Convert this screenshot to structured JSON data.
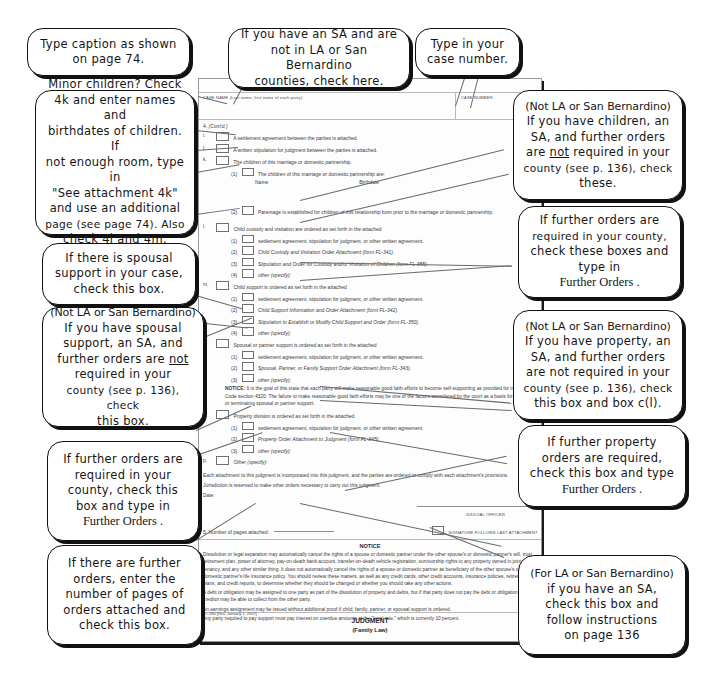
{
  "page": {
    "background": "#ffffff",
    "callout_border": "#111111",
    "form_border": "#9a9a9a"
  },
  "form": {
    "form_code": "FL-180",
    "case_name_label": "CASE NAME (Last name, first name of each party):",
    "case_number_label": "CASE NUMBER:",
    "section_number": "4.",
    "section_contd": "(Cont'd.)",
    "items": [
      {
        "letter": "i.",
        "text": "A settlement agreement between the parties is attached."
      },
      {
        "letter": "j.",
        "text": "A written stipulation for judgment between the parties is attached."
      },
      {
        "letter": "k.",
        "text": "The children of this marriage or domestic partnership."
      }
    ],
    "k_sub": [
      {
        "num": "(1)",
        "text": "The children of this marriage or domestic partnership are:",
        "cols": [
          "Name",
          "Birthdate"
        ]
      },
      {
        "num": "(2)",
        "text": "Parentage is established for children of this relationship born prior to the marriage or domestic partnership."
      }
    ],
    "l_item": {
      "letter": "l.",
      "heading": "Child custody and visitation are ordered as set forth in the attached",
      "subs": [
        {
          "num": "(1)",
          "text": "settlement agreement, stipulation for judgment, or other written agreement.",
          "italic": false
        },
        {
          "num": "(2)",
          "text": "Child Custody and Visitation Order Attachment (form FL-341).",
          "italic": true
        },
        {
          "num": "(3)",
          "text": "Stipulation and Order for Custody and/or Visitation of Children (form FL-355).",
          "italic": true
        },
        {
          "num": "(4)",
          "text": "other (specify):",
          "italic": true
        }
      ]
    },
    "m_item": {
      "letter": "m.",
      "heading": "Child support is ordered as set forth in the attached",
      "subs": [
        {
          "num": "(1)",
          "text": "settlement agreement, stipulation for judgment, or other written agreement.",
          "italic": false
        },
        {
          "num": "(2)",
          "text": "Child Support Information and Order Attachment (form FL-342).",
          "italic": true
        },
        {
          "num": "(3)",
          "text": "Stipulation to Establish or Modify Child Support and Order (form FL-350).",
          "italic": true
        },
        {
          "num": "(4)",
          "text": "other (specify):",
          "italic": true
        }
      ]
    },
    "n_item": {
      "letter": "n.",
      "heading": "Spousal or partner support is ordered as set forth in the attached",
      "subs": [
        {
          "num": "(1)",
          "text": "settlement agreement, stipulation for judgment, or other written agreement.",
          "italic": false
        },
        {
          "num": "(2)",
          "text": "Spousal, Partner, or Family Support Order Attachment (form FL-343).",
          "italic": true
        },
        {
          "num": "(3)",
          "text": "other (specify):",
          "italic": true
        }
      ],
      "notice_label": "NOTICE:",
      "notice_text": "It is the goal of this state that each party will make reasonable good faith efforts to become self-supporting as provided for in Family Code section 4320. The failure to make reasonable good faith efforts may be one of the factors considered by the court as a basis for modifying or terminating spousal or partner support."
    },
    "o_item": {
      "letter": "o.",
      "heading": "Property division is ordered as set forth in the attached",
      "subs": [
        {
          "num": "(1)",
          "text": "settlement agreement, stipulation for judgment, or other written agreement.",
          "italic": false
        },
        {
          "num": "(2)",
          "text": "Property Order Attachment to Judgment (form FL-345).",
          "italic": true
        },
        {
          "num": "(3)",
          "text": "other (specify):",
          "italic": true
        }
      ]
    },
    "p_item": {
      "letter": "p.",
      "text": "Other (specify):"
    },
    "closing": [
      "Each attachment to this judgment is incorporated into this judgment, and the parties are ordered to comply with each attachment's provisions.",
      "Jurisdiction is reserved to make other orders necessary to carry out this judgment."
    ],
    "date_label": "Date:",
    "judicial_officer_label": "JUDICIAL OFFICER",
    "pages_attached_label": "5.  Number of pages attached:",
    "signature_follows_label": "SIGNATURE FOLLOWS LAST ATTACHMENT",
    "notice_heading": "NOTICE",
    "notice_paragraphs": [
      "Dissolution or legal separation may automatically cancel the rights of a spouse or domestic partner under the other spouse's or domestic partner's will, trust, retirement plan, power of attorney, pay-on-death bank account, transfer-on-death vehicle registration, survivorship rights to any property owned in joint tenancy, and any other similar thing. It does not automatically cancel the rights of a spouse or domestic partner as beneficiary of the other spouse's or domestic partner's life insurance policy. You should review these matters, as well as any credit cards, other credit accounts, insurance policies, retirement plans, and credit reports, to determine whether they should be changed or whether you should take any other actions.",
      "A debt or obligation may be assigned to one party as part of the dissolution of property and debts, but if that party does not pay the debt or obligation, the creditor may be able to collect from the other party.",
      "An earnings assignment may be issued without additional proof if child, family, partner, or spousal support is ordered.",
      "Any party required to pay support must pay interest on overdue amounts at the \"legal rate,\" which is currently 10 percent."
    ],
    "revision": "FL-180 [Rev. January 1, 2007]",
    "judgment_title": "JUDGMENT",
    "judgment_subtitle": "(Family Law)"
  },
  "callouts": {
    "caption": {
      "name": "type-caption-callout",
      "lines": [
        "Type caption as shown",
        "on page 74."
      ]
    },
    "sa_not_la": {
      "name": "sa-not-la-callout",
      "lines": [
        "If you have an SA and are",
        "not in LA or San Bernardino",
        "counties, check here."
      ]
    },
    "case_number": {
      "name": "case-number-callout",
      "lines": [
        "Type in your",
        "case number."
      ]
    },
    "minor_children": {
      "name": "minor-children-callout",
      "lines": [
        "Minor children? Check",
        "4k and enter names and",
        "birthdates of children. If",
        "not enough room, type in",
        "\"See attachment 4k\"",
        "and use an additional",
        "page (see page 74). Also",
        "check 4l and 4m."
      ]
    },
    "spousal_support": {
      "name": "spousal-support-callout",
      "lines": [
        "If there is spousal",
        "support in your case,",
        "check this box."
      ]
    },
    "spousal_not_la": {
      "name": "spousal-not-la-callout",
      "header": "(Not LA or San Bernardino)",
      "lines": [
        "If you have spousal",
        "support, an SA, and",
        "further orders are not",
        "required in your",
        "county (see p. 136), check",
        "this box."
      ],
      "underlined_word": "not"
    },
    "further_orders_left": {
      "name": "further-orders-left-callout",
      "lines": [
        "If further orders are",
        "required in your",
        "county, check this",
        "box and type in"
      ],
      "serif_line": "Further Orders ."
    },
    "pages_of_orders": {
      "name": "pages-of-orders-callout",
      "lines": [
        "If there are further",
        "orders, enter the",
        "number of pages of",
        "orders attached and",
        "check this box."
      ]
    },
    "children_not_la": {
      "name": "children-not-la-callout",
      "header": "(Not LA or San Bernardino)",
      "lines": [
        "If you have children, an",
        "SA, and further orders",
        "are not required in your",
        "county (see p. 136), check",
        "these."
      ],
      "underlined_word": "not"
    },
    "further_orders_right": {
      "name": "further-orders-right-callout",
      "lines": [
        "If further orders are",
        "required in your county,",
        "check these boxes and",
        "type in"
      ],
      "serif_line": "Further Orders ."
    },
    "property_not_la": {
      "name": "property-not-la-callout",
      "header": "(Not LA or San Bernardino)",
      "lines": [
        "If you have property, an",
        "SA, and further orders",
        "are not required in your",
        "county (see p. 136), check",
        "this box and box c(l)."
      ]
    },
    "further_property": {
      "name": "further-property-orders-callout",
      "lines": [
        "If further property",
        "orders are required,",
        "check this box and type"
      ],
      "serif_line": "Further Orders ."
    },
    "for_la": {
      "name": "for-la-callout",
      "header": "(For LA or San Bernardino)",
      "lines": [
        "if you have an SA,",
        "check this box and",
        "follow instructions",
        "on page 136"
      ]
    }
  }
}
